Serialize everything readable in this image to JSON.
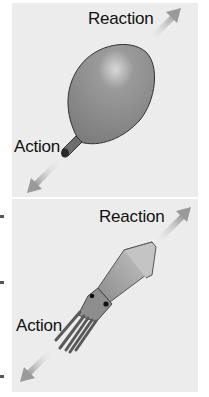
{
  "figure": {
    "panels": [
      {
        "object": "balloon",
        "labels": {
          "reaction": "Reaction",
          "action": "Action"
        }
      },
      {
        "object": "squid",
        "labels": {
          "reaction": "Reaction",
          "action": "Action"
        }
      }
    ],
    "colors": {
      "background": "#ececec",
      "arrow": "#a8a8a8",
      "balloon": "#8a8a8a",
      "squid_body": "#b0b0b0",
      "squid_arms": "#777777",
      "text": "#111111"
    }
  }
}
